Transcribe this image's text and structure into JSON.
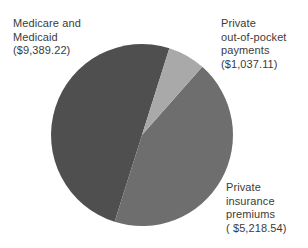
{
  "chart_data": {
    "type": "pie",
    "title": "",
    "subtitle": "",
    "xlabel": "",
    "ylabel": "",
    "legend_position": "none",
    "grid": false,
    "total": 15644.87,
    "currency": "USD",
    "slices": [
      {
        "name": "Medicare and Medicaid",
        "value": 9389.22,
        "value_text": "($9,389.22)",
        "percent": 60.0,
        "color": "#4f4f4f",
        "start_angle_deg": 197.5,
        "end_angle_deg": 377.5,
        "label_lines": [
          "Medicare and",
          "Medicaid",
          "($9,389.22)"
        ]
      },
      {
        "name": "Private out-of-pocket payments",
        "value": 1037.11,
        "value_text": "($1,037.11)",
        "percent": 6.6,
        "color": "#a9a9a9",
        "start_angle_deg": 17.5,
        "end_angle_deg": 41.5,
        "label_lines": [
          "Private",
          "out-of-pocket",
          "payments",
          "($1,037.11)"
        ]
      },
      {
        "name": "Private insurance premiums",
        "value": 5218.54,
        "value_text": "( $5,218.54)",
        "percent": 33.4,
        "color": "#6e6e6e",
        "start_angle_deg": 41.5,
        "end_angle_deg": 197.5,
        "label_lines": [
          "Private",
          "insurance",
          "premiums",
          "( $5,218.54)"
        ]
      }
    ]
  },
  "labels": {
    "medicare": {
      "line1": "Medicare and",
      "line2": "Medicaid",
      "line3": "($9,389.22)"
    },
    "out_of_pocket": {
      "line1": "Private",
      "line2": "out-of-pocket",
      "line3": "payments",
      "line4": "($1,037.11)"
    },
    "premiums": {
      "line1": "Private",
      "line2": "insurance",
      "line3": "premiums",
      "line4": "( $5,218.54)"
    }
  },
  "geometry": {
    "center_x": 142,
    "center_y": 135,
    "radius": 91
  },
  "colors": {
    "background": "#ffffff",
    "text": "#3b3b3b",
    "slice_medicare": "#4f4f4f",
    "slice_out_of_pocket": "#a9a9a9",
    "slice_premiums": "#6e6e6e"
  }
}
